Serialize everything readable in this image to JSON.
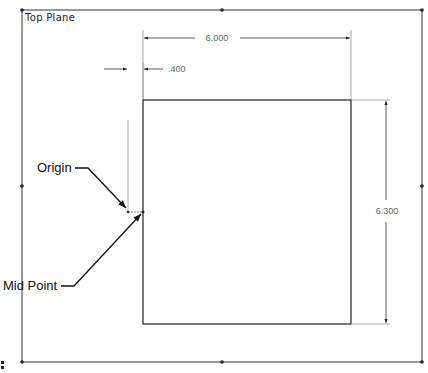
{
  "plane": {
    "label": "Top Plane"
  },
  "dimensions": {
    "width": "6.000",
    "height": "6.300",
    "offset": ".400"
  },
  "callouts": {
    "origin": "Origin",
    "mid_point": "Mid Point"
  },
  "colors": {
    "frame": "#333333",
    "sketch": "#222222",
    "dimension_text": "#666666"
  }
}
